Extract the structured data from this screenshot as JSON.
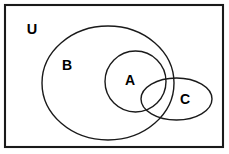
{
  "diagram": {
    "type": "venn-diagram",
    "title": "",
    "background_color": "#ffffff",
    "stroke_color": "#1a1a1a",
    "label_color": "#000000",
    "universe": {
      "label": "U",
      "shape": "rectangle",
      "x": 5,
      "y": 5,
      "width": 218,
      "height": 142,
      "stroke_width": 2.1,
      "label_x": 32,
      "label_y": 29
    },
    "sets": [
      {
        "id": "set-b",
        "label": "B",
        "shape": "ellipse",
        "cx": 108,
        "cy": 83,
        "rx": 66,
        "ry": 57,
        "stroke_width": 1.4,
        "label_x": 67,
        "label_y": 65
      },
      {
        "id": "set-a",
        "label": "A",
        "shape": "circle",
        "cx": 135.5,
        "cy": 81.5,
        "rx": 30.5,
        "ry": 30.5,
        "stroke_width": 1.4,
        "label_x": 130,
        "label_y": 80
      },
      {
        "id": "set-c",
        "label": "C",
        "shape": "ellipse",
        "cx": 176.5,
        "cy": 99,
        "rx": 35.5,
        "ry": 21,
        "stroke_width": 1.4,
        "label_x": 185,
        "label_y": 99
      }
    ],
    "relations": [
      "A is a subset of B",
      "C overlaps A and B",
      "C extends outside B",
      "A, B and C are all inside U"
    ]
  }
}
